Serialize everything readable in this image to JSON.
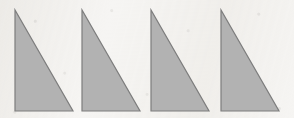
{
  "figure": {
    "background_color": "#f6f5f3",
    "width": 294,
    "height": 118,
    "shape_fill_color": "#b2b2b2",
    "shape_stroke_color": "#7d7d7d",
    "shape_stroke_width": 1.2,
    "shape_count": 4,
    "shape_type": "right-triangle",
    "orientation": "vertical leg on left, horizontal leg on bottom, hypotenuse from top-left apex down to bottom-right vertex"
  },
  "shapes": [
    {
      "name": "triangle-1",
      "apex": {
        "x": 15,
        "y": 10
      },
      "bottom_left": {
        "x": 15,
        "y": 111
      },
      "bottom_right": {
        "x": 73,
        "y": 111
      },
      "points": "15,10 15,111 73,111",
      "leg_vertical": 101,
      "leg_horizontal": 58
    },
    {
      "name": "triangle-2",
      "apex": {
        "x": 82,
        "y": 10
      },
      "bottom_left": {
        "x": 82,
        "y": 111
      },
      "bottom_right": {
        "x": 140,
        "y": 111
      },
      "points": "82,10 82,111 140,111",
      "leg_vertical": 101,
      "leg_horizontal": 58
    },
    {
      "name": "triangle-3",
      "apex": {
        "x": 151,
        "y": 10
      },
      "bottom_left": {
        "x": 151,
        "y": 111
      },
      "bottom_right": {
        "x": 209,
        "y": 111
      },
      "points": "151,10 151,111 209,111",
      "leg_vertical": 101,
      "leg_horizontal": 58
    },
    {
      "name": "triangle-4",
      "apex": {
        "x": 221,
        "y": 10
      },
      "bottom_left": {
        "x": 221,
        "y": 111
      },
      "bottom_right": {
        "x": 279,
        "y": 111
      },
      "points": "221,10 221,111 279,111",
      "leg_vertical": 101,
      "leg_horizontal": 58
    }
  ]
}
